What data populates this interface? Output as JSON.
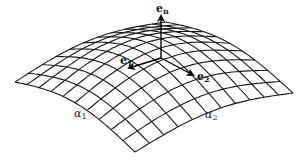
{
  "figure": {
    "grid": {
      "cells_alpha1": 10,
      "cells_alpha2": 11
    },
    "vectors": [
      {
        "name": "e_n",
        "base": "e",
        "subscript": "n"
      },
      {
        "name": "e_1",
        "base": "e",
        "subscript": "1"
      },
      {
        "name": "e_2",
        "base": "e",
        "subscript": "2"
      }
    ],
    "coordinate_labels": [
      {
        "name": "alpha_1",
        "base": "α",
        "subscript": "1"
      },
      {
        "name": "alpha_2",
        "base": "α",
        "subscript": "2"
      }
    ],
    "colors": {
      "line": "#1a1a1a",
      "background": "#ffffff"
    }
  }
}
